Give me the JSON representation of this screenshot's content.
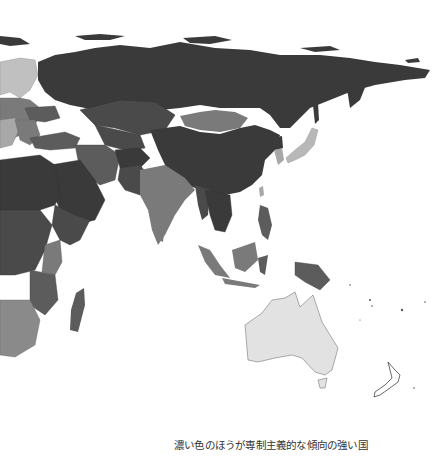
{
  "map": {
    "title": "Eastern hemisphere authoritarianism choropleth",
    "colors": {
      "very_dark": "#3a3a3a",
      "dark": "#4a4a4a",
      "medium_dark": "#5c5c5c",
      "medium": "#7a7a7a",
      "light": "#a8a8a8",
      "very_light": "#e2e2e2",
      "ocean": "#ffffff"
    }
  },
  "caption": "濃い色のほうが専制主義的な傾向の強い国"
}
